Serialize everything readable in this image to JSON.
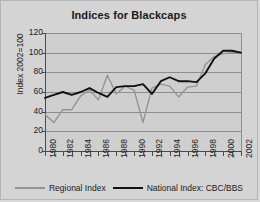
{
  "chart_data": {
    "type": "line",
    "title": "Indices for Blackcaps",
    "xlabel": "",
    "ylabel": "Index 2002=100",
    "xlim": [
      1980,
      2002
    ],
    "ylim": [
      0,
      120
    ],
    "yticks": [
      0,
      20,
      40,
      60,
      80,
      100,
      120
    ],
    "xticks": [
      1980,
      1981,
      1982,
      1983,
      1984,
      1985,
      1986,
      1987,
      1988,
      1989,
      1990,
      1991,
      1992,
      1993,
      1994,
      1995,
      1996,
      1997,
      1998,
      1999,
      2000,
      2001,
      2002
    ],
    "xtick_labels": [
      "1980",
      "",
      "1982",
      "",
      "1984",
      "",
      "1986",
      "",
      "1988",
      "",
      "1990",
      "",
      "1992",
      "",
      "1994",
      "",
      "1996",
      "",
      "1998",
      "",
      "2000",
      "",
      "2002"
    ],
    "grid": true,
    "legend_position": "bottom",
    "x": [
      1980,
      1981,
      1982,
      1983,
      1984,
      1985,
      1986,
      1987,
      1988,
      1989,
      1990,
      1991,
      1992,
      1993,
      1994,
      1995,
      1996,
      1997,
      1998,
      1999,
      2000,
      2001,
      2002
    ],
    "series": [
      {
        "name": "Regional Index",
        "color": "#949494",
        "values": [
          37,
          29,
          42,
          42,
          56,
          62,
          52,
          77,
          58,
          66,
          62,
          29,
          64,
          68,
          66,
          55,
          65,
          66,
          88,
          96,
          99,
          100,
          100
        ]
      },
      {
        "name": "National Index: CBC/BBS",
        "color": "#111111",
        "values": [
          54,
          57,
          60,
          57,
          60,
          64,
          59,
          55,
          65,
          66,
          66,
          68,
          58,
          71,
          75,
          71,
          71,
          70,
          79,
          94,
          102,
          102,
          100
        ]
      }
    ]
  },
  "legend": {
    "entries": [
      {
        "label": "Regional Index"
      },
      {
        "label": "National Index: CBC/BBS"
      }
    ]
  },
  "axes": {
    "y_title": "Index 2002=100"
  }
}
